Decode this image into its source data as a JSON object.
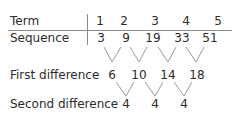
{
  "table": {
    "row_labels": {
      "term": "Term",
      "sequence": "Sequence",
      "first_difference": "First difference",
      "second_difference": "Second difference"
    },
    "terms": [
      "1",
      "2",
      "3",
      "4",
      "5"
    ],
    "sequence": [
      "3",
      "9",
      "19",
      "33",
      "51"
    ],
    "first_differences": [
      "6",
      "10",
      "14",
      "18"
    ],
    "second_differences": [
      "4",
      "4",
      "4"
    ]
  },
  "colors": {
    "text": "#2b2b2b",
    "rule": "#8a8a8a",
    "connector": "#9a9a9a"
  }
}
